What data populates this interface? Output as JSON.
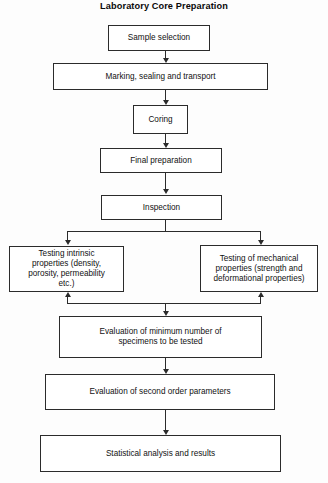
{
  "title": "Laboratory Core Preparation",
  "diagram_data": {
    "type": "flowchart",
    "orientation": "top-to-bottom",
    "nodes": [
      {
        "id": "sample_selection",
        "label": "Sample selection"
      },
      {
        "id": "marking",
        "label": "Marking, sealing and transport"
      },
      {
        "id": "coring",
        "label": "Coring"
      },
      {
        "id": "final_preparation",
        "label": "Final preparation"
      },
      {
        "id": "inspection",
        "label": "Inspection"
      },
      {
        "id": "testing_intrinsic",
        "label": "Testing intrinsic properties (density, porosity, permeability etc.)"
      },
      {
        "id": "testing_mechanical",
        "label": "Testing of mechanical properties (strength and deformational properties)"
      },
      {
        "id": "evaluation_minimum",
        "label": "Evaluation of minimum number of specimens to be tested"
      },
      {
        "id": "evaluation_second",
        "label": "Evaluation of second order parameters"
      },
      {
        "id": "statistical",
        "label": "Statistical analysis and results"
      }
    ],
    "edges": [
      {
        "from": "sample_selection",
        "to": "marking"
      },
      {
        "from": "marking",
        "to": "coring"
      },
      {
        "from": "coring",
        "to": "final_preparation"
      },
      {
        "from": "final_preparation",
        "to": "inspection"
      },
      {
        "from": "inspection",
        "to": "testing_intrinsic"
      },
      {
        "from": "inspection",
        "to": "testing_mechanical"
      },
      {
        "from": "testing_intrinsic",
        "to": "evaluation_minimum"
      },
      {
        "from": "testing_mechanical",
        "to": "evaluation_minimum"
      },
      {
        "from": "evaluation_minimum",
        "to": "evaluation_second"
      },
      {
        "from": "evaluation_second",
        "to": "statistical"
      }
    ],
    "line_color": "#2b2b2b",
    "box_fill": "#ffffff",
    "background": "#fdfdfd"
  },
  "labels": {
    "sample_selection": "Sample selection",
    "marking": "Marking, sealing and transport",
    "coring": "Coring",
    "final_preparation": "Final preparation",
    "inspection": "Inspection",
    "testing_intrinsic": "Testing intrinsic\nproperties (density,\nporosity, permeability\netc.)",
    "testing_mechanical": "Testing of mechanical\nproperties (strength and\ndeformational properties)",
    "evaluation_minimum": "Evaluation of minimum number of\nspecimens to be tested",
    "evaluation_second": "Evaluation of second order parameters",
    "statistical": "Statistical analysis and results"
  }
}
